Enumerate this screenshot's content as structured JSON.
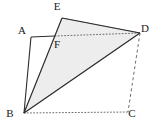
{
  "figure": {
    "kind": "geometry-diagram",
    "width": 158,
    "height": 129,
    "background_color": "#ffffff",
    "stroke_color": "#2b2b2b",
    "dash_color": "#5a5a5a",
    "shade_color": "#ededed",
    "shade_edge_color": "#8a8a8a",
    "points": [
      {
        "id": "A",
        "label": "A",
        "x": 31,
        "y": 37,
        "label_x": 22,
        "label_y": 34
      },
      {
        "id": "B",
        "label": "B",
        "x": 24,
        "y": 113,
        "label_x": 10,
        "label_y": 117
      },
      {
        "id": "C",
        "label": "C",
        "x": 128,
        "y": 112,
        "label_x": 132,
        "label_y": 117
      },
      {
        "id": "D",
        "label": "D",
        "x": 140,
        "y": 33,
        "label_x": 144,
        "label_y": 32
      },
      {
        "id": "E",
        "label": "E",
        "x": 62,
        "y": 18,
        "label_x": 57,
        "label_y": 10
      },
      {
        "id": "F",
        "label": "F",
        "x": 55,
        "y": 36,
        "label_x": 56,
        "label_y": 48
      }
    ],
    "edges": [
      {
        "id": "AB",
        "from": "A",
        "to": "B",
        "style": "solid"
      },
      {
        "id": "AF",
        "from": "A",
        "to": "F",
        "style": "solid"
      },
      {
        "id": "FD",
        "from": "F",
        "to": "D",
        "style": "dotted"
      },
      {
        "id": "BE",
        "from": "B",
        "to": "E",
        "style": "solid"
      },
      {
        "id": "ED",
        "from": "E",
        "to": "D",
        "style": "solid"
      },
      {
        "id": "BD",
        "from": "B",
        "to": "D",
        "style": "solid"
      },
      {
        "id": "BC",
        "from": "B",
        "to": "C",
        "style": "dotted"
      },
      {
        "id": "DC",
        "from": "D",
        "to": "C",
        "style": "dashed"
      }
    ],
    "shaded_region": {
      "id": "BFED",
      "vertices": [
        "B",
        "F",
        "E",
        "D"
      ],
      "points_attr": "24,113 55,36 62,18 140,33"
    }
  }
}
